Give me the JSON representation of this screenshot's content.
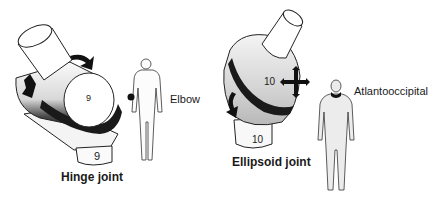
{
  "figure": {
    "panels": [
      {
        "id": "hinge",
        "title": "Hinge joint",
        "example_label": "Elbow",
        "bone_number_top": "9",
        "bone_number_bottom": "9"
      },
      {
        "id": "ellipsoid",
        "title": "Ellipsoid joint",
        "example_label": "Atlantooccipital",
        "bone_number_top": "10",
        "bone_number_bottom": "10"
      }
    ]
  },
  "colors": {
    "line": "#222222",
    "fill_light": "#f2f2f2",
    "fill_mid": "#cfcfcf",
    "band_dark": "#1a1a1a",
    "highlight": "#000000"
  }
}
